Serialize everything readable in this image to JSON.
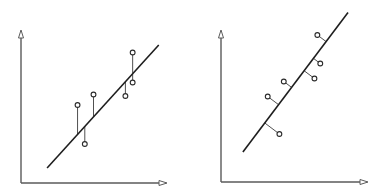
{
  "diagram": {
    "colors": {
      "axis": "#5a5a5a",
      "line": "#1e1e1e",
      "point_fill": "#ffffff"
    },
    "panels": [
      {
        "id": "vertical-residuals",
        "residual_type": "vertical",
        "line": {
          "x1": 0.18,
          "y1": 0.1,
          "x2": 0.95,
          "y2": 0.92
        },
        "points": [
          {
            "x": 0.39,
            "y": 0.52
          },
          {
            "x": 0.44,
            "y": 0.26
          },
          {
            "x": 0.5,
            "y": 0.59
          },
          {
            "x": 0.72,
            "y": 0.58
          },
          {
            "x": 0.77,
            "y": 0.87
          },
          {
            "x": 0.77,
            "y": 0.67
          }
        ]
      },
      {
        "id": "perpendicular-residuals",
        "residual_type": "perpendicular",
        "line": {
          "x1": 0.15,
          "y1": 0.2,
          "x2": 0.87,
          "y2": 1.13
        },
        "points": [
          {
            "x": 0.66,
            "y": 0.98
          },
          {
            "x": 0.68,
            "y": 0.79
          },
          {
            "x": 0.64,
            "y": 0.69
          },
          {
            "x": 0.43,
            "y": 0.67
          },
          {
            "x": 0.32,
            "y": 0.57
          },
          {
            "x": 0.4,
            "y": 0.32
          }
        ]
      }
    ]
  }
}
